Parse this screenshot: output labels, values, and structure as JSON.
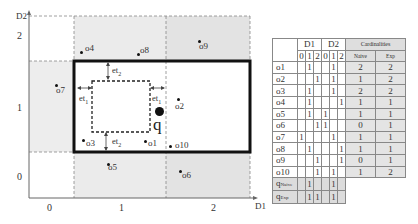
{
  "figure": {
    "axes": {
      "x_label": "D1",
      "y_label": "D2",
      "x_ticks": [
        "0",
        "1",
        "2"
      ],
      "y_ticks": [
        "0",
        "1",
        "2"
      ]
    },
    "objects": [
      {
        "id": "o1",
        "label": "o1"
      },
      {
        "id": "o2",
        "label": "o2"
      },
      {
        "id": "o3",
        "label": "o3"
      },
      {
        "id": "o4",
        "label": "o4"
      },
      {
        "id": "o5",
        "label": "o5"
      },
      {
        "id": "o6",
        "label": "o6"
      },
      {
        "id": "o7",
        "label": "o7"
      },
      {
        "id": "o8",
        "label": "o8"
      },
      {
        "id": "o9",
        "label": "o9"
      },
      {
        "id": "o10",
        "label": "o10"
      }
    ],
    "query_label": "q",
    "et1": "et",
    "et1_sub": "1",
    "et2": "et",
    "et2_sub": "2",
    "colors": {
      "shade": "#ececec",
      "shade_dark": "#e2e2e2",
      "thick_border": "#111111",
      "grid": "#888888"
    }
  },
  "table": {
    "headers": {
      "d1": "D1",
      "d2": "D2",
      "cardinalities": "Cardinalities",
      "sub": [
        "0",
        "1",
        "2",
        "0",
        "1",
        "2"
      ],
      "naive": "Naive",
      "exp": "Exp"
    },
    "rows": [
      {
        "label": "o1",
        "d1": [
          "",
          "1",
          ""
        ],
        "d2": [
          "",
          "1",
          ""
        ],
        "naive": "2",
        "exp": "2"
      },
      {
        "label": "o2",
        "d1": [
          "",
          "",
          "1"
        ],
        "d2": [
          "",
          "1",
          ""
        ],
        "naive": "1",
        "exp": "2"
      },
      {
        "label": "o3",
        "d1": [
          "",
          "1",
          ""
        ],
        "d2": [
          "",
          "1",
          ""
        ],
        "naive": "2",
        "exp": "2"
      },
      {
        "label": "o4",
        "d1": [
          "",
          "1",
          ""
        ],
        "d2": [
          "",
          "",
          "1"
        ],
        "naive": "1",
        "exp": "1"
      },
      {
        "label": "o5",
        "d1": [
          "",
          "1",
          ""
        ],
        "d2": [
          "1",
          "",
          ""
        ],
        "naive": "1",
        "exp": "1"
      },
      {
        "label": "o6",
        "d1": [
          "",
          "",
          "1"
        ],
        "d2": [
          "1",
          "",
          ""
        ],
        "naive": "0",
        "exp": "1"
      },
      {
        "label": "o7",
        "d1": [
          "1",
          "",
          ""
        ],
        "d2": [
          "",
          "1",
          ""
        ],
        "naive": "1",
        "exp": "1"
      },
      {
        "label": "o8",
        "d1": [
          "",
          "1",
          ""
        ],
        "d2": [
          "",
          "",
          "1"
        ],
        "naive": "1",
        "exp": "1"
      },
      {
        "label": "o9",
        "d1": [
          "",
          "",
          "1"
        ],
        "d2": [
          "",
          "",
          "1"
        ],
        "naive": "0",
        "exp": "1"
      },
      {
        "label": "o10",
        "d1": [
          "",
          "",
          "1"
        ],
        "d2": [
          "",
          "1",
          ""
        ],
        "naive": "1",
        "exp": "2"
      }
    ],
    "query_rows": [
      {
        "label": "q",
        "sub": "Naive",
        "d1": [
          "",
          "1",
          ""
        ],
        "d2": [
          "",
          "1",
          ""
        ]
      },
      {
        "label": "q",
        "sub": "Exp",
        "d1": [
          "",
          "1",
          "1"
        ],
        "d2": [
          "",
          "1",
          ""
        ]
      }
    ]
  }
}
